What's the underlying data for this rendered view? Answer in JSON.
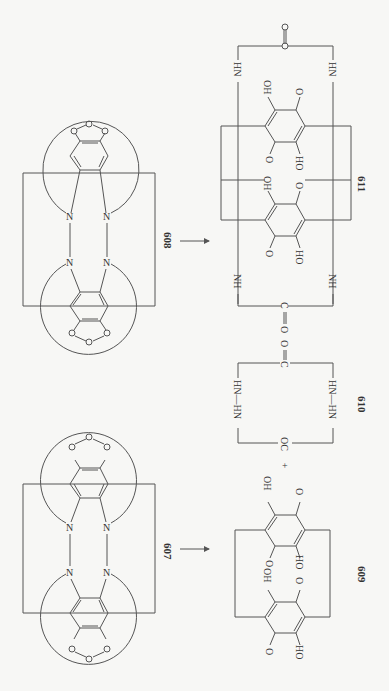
{
  "header": {
    "text": ""
  },
  "diagram": {
    "orientation": "rotated 90 degrees clockwise",
    "line_color": "#555555",
    "background": "#f7f7f5",
    "compounds": [
      {
        "id": "608",
        "label": "608",
        "description": "bis-catechol carbonate cyclophane with azo bridges"
      },
      {
        "id": "607",
        "label": "607",
        "description": "bis-catechol carbonate cyclophane with azo bridges"
      },
      {
        "id": "611",
        "label": "611",
        "description": "bis-dihydroxyquinone cyclophane with urea bridges"
      },
      {
        "id": "610",
        "label": "610",
        "description": "cyclic bis-hydrazide urea"
      },
      {
        "id": "609",
        "label": "609",
        "description": "bis-dihydroxyquinone cyclophane"
      }
    ],
    "atoms": {
      "N": "N",
      "O": "O",
      "C": "C",
      "OH": "OH",
      "HO": "HO",
      "NH": "NH",
      "HN": "HN",
      "OC": "OC",
      "NH_NH": "NH—NH",
      "HN_HN": "HN—HN"
    },
    "plus": "+",
    "arrows": [
      {
        "from": "608",
        "to": "611"
      },
      {
        "from": "607",
        "to": "609 + 610"
      }
    ]
  }
}
